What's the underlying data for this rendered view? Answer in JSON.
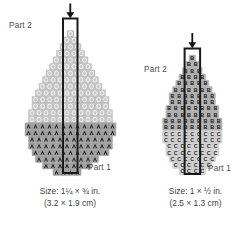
{
  "figure": {
    "type": "beading-pattern-diagram",
    "background": "#ffffff",
    "ink": "#2b2b2b"
  },
  "panels": [
    {
      "id": "left",
      "name": "large-leaf-pattern",
      "arrow": {
        "name": "thread-direction-arrow",
        "direction": "down"
      },
      "labels": {
        "part2": "Part 2",
        "part1": "Part 1"
      },
      "caption": {
        "imperial": "Size: 1¼ × ¾ in.",
        "metric": "(3.2 × 1.9 cm)"
      },
      "regions": [
        {
          "name": "upper-region",
          "bead_letter": "",
          "bead_fill": "#c9c9c9",
          "bead_mark": "oval-outline",
          "mark_color": "#efefef"
        },
        {
          "name": "lower-region",
          "bead_letter": "A",
          "bead_fill": "#a3a3a3",
          "mark_color": "#1e1e1e"
        }
      ],
      "row_counts_upper": [
        1,
        2,
        3,
        4,
        5,
        6,
        7,
        8,
        9,
        10,
        11,
        11,
        12,
        12,
        13,
        13
      ],
      "row_counts_lower": [
        13,
        13,
        12,
        12,
        11,
        10,
        9,
        8,
        6,
        4,
        2
      ]
    },
    {
      "id": "right",
      "name": "small-leaf-pattern",
      "arrow": {
        "name": "thread-direction-arrow",
        "direction": "down"
      },
      "labels": {
        "part2": "Part 2",
        "part1": "Part 1"
      },
      "caption": {
        "imperial": "Size: 1 × ½ in.",
        "metric": "(2.5 × 1.3 cm)"
      },
      "regions": [
        {
          "name": "upper-region",
          "bead_letter": "B",
          "bead_fill": "#b5b5b5",
          "mark_color": "#1e1e1e"
        },
        {
          "name": "lower-region",
          "bead_letter": "C",
          "bead_fill": "#d6d6d6",
          "mark_color": "#2a2a2a"
        }
      ],
      "row_counts_upper": [
        1,
        2,
        3,
        4,
        5,
        6,
        7,
        7,
        8,
        8,
        9,
        9
      ],
      "row_counts_lower": [
        9,
        9,
        8,
        8,
        7,
        6,
        4,
        3
      ]
    }
  ],
  "colors": {
    "outline": "#1a1a1a",
    "bead_light": "#c9c9c9",
    "bead_mid": "#b5b5b5",
    "bead_dark": "#a3a3a3",
    "bead_pale": "#d6d6d6",
    "label_text": "#4a4a4a",
    "caption_text": "#3d3d3d"
  }
}
